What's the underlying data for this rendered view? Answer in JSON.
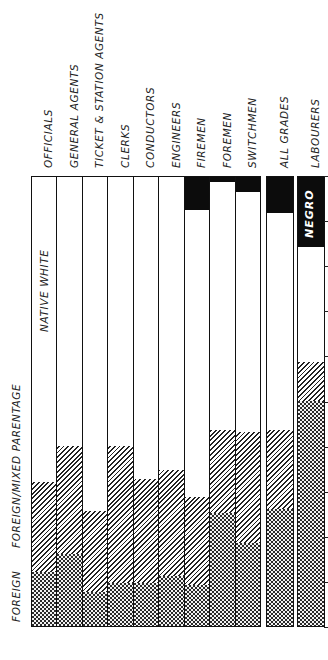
{
  "chart_data": {
    "type": "bar",
    "stacked": true,
    "orientation": "vertical (page rotated 90°)",
    "title": "",
    "xlabel": "",
    "ylabel": "",
    "ylim": [
      0,
      100
    ],
    "units": "percent of employees",
    "categories": [
      "OFFICIALS",
      "GENERAL AGENTS",
      "TICKET & STATION AGENTS",
      "CLERKS",
      "CONDUCTORS",
      "ENGINEERS",
      "FIREMEN",
      "FOREMEN",
      "SWITCHMEN",
      "ALL GRADES",
      "LABOURERS"
    ],
    "series": [
      {
        "name": "FOREIGN",
        "pattern": "dark-checker",
        "values": [
          12,
          16,
          7.5,
          9.5,
          9.5,
          11,
          9,
          25,
          18.5,
          26,
          50
        ]
      },
      {
        "name": "FOREIGN/MIXED PARENTAGE",
        "pattern": "diagonal-hatch",
        "values": [
          20,
          24,
          18,
          30.5,
          23,
          23.5,
          19.5,
          18.5,
          24.5,
          17.5,
          8.5
        ]
      },
      {
        "name": "NATIVE WHITE",
        "pattern": "white",
        "values": [
          68,
          60,
          74.5,
          60,
          67.5,
          65.5,
          64.2,
          55.5,
          53.7,
          48.5,
          26
        ]
      },
      {
        "name": "NEGRO",
        "pattern": "solid-black",
        "values": [
          0,
          0,
          0,
          0,
          0,
          0,
          7.3,
          1,
          3.3,
          8,
          15.5
        ]
      }
    ],
    "tick_count": 10,
    "grid": false,
    "legend": "inline labels on first and last bars"
  },
  "labels": {
    "foreign": "FOREIGN",
    "mixed": "FOREIGN/MIXED PARENTAGE",
    "native": "NATIVE WHITE",
    "negro": "NEGRO"
  },
  "colors": {
    "ink": "#111111",
    "paper": "#ffffff"
  }
}
